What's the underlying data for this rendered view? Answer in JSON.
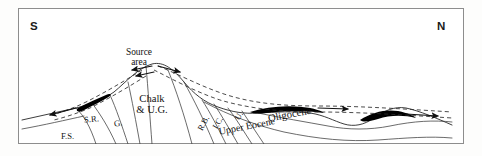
{
  "figure": {
    "orientation": {
      "left_label": "S",
      "right_label": "N"
    },
    "frame_color": "#8d8d8d",
    "background": "#ffffff",
    "line_color": "#1a1a1a",
    "lens_color": "#000000"
  },
  "annotations": {
    "source_area": "Source\narea",
    "source_area_line1": "Source",
    "source_area_line2": "area"
  },
  "units": [
    {
      "id": "chalk-ug",
      "label": "Chalk\n& U.G.",
      "line1": "Chalk",
      "line2": "& U.G."
    },
    {
      "id": "sr",
      "label": "S.R."
    },
    {
      "id": "g",
      "label": "G."
    },
    {
      "id": "fs",
      "label": "F.S."
    },
    {
      "id": "rb",
      "label": "R.B."
    },
    {
      "id": "ic",
      "label": "I.C."
    },
    {
      "id": "u",
      "label": "U."
    },
    {
      "id": "upper-eocene",
      "label": "Upper Eocene"
    },
    {
      "id": "oligocene",
      "label": "Oligocene"
    }
  ],
  "flow_arrows": [
    {
      "id": "arrow-source-left",
      "direction": "left",
      "description": "transport away from source area toward S"
    },
    {
      "id": "arrow-source-right",
      "direction": "right",
      "description": "transport away from source area toward N"
    },
    {
      "id": "arrow-far-left",
      "direction": "left",
      "description": "southward sediment transport"
    },
    {
      "id": "arrow-mid-right",
      "direction": "right",
      "description": "northward sediment transport"
    },
    {
      "id": "arrow-far-right",
      "direction": "right",
      "description": "northward sediment transport"
    }
  ],
  "lenses": [
    {
      "id": "lens-south",
      "description": "black sediment lens on southern flank"
    },
    {
      "id": "lens-north-1",
      "description": "black sediment lens in Oligocene, north flank"
    },
    {
      "id": "lens-north-2",
      "description": "black sediment lens in Oligocene, far north"
    }
  ]
}
